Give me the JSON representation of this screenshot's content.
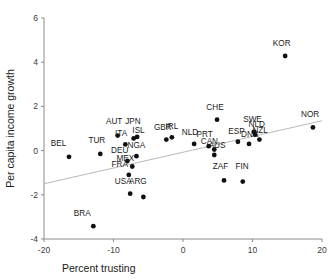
{
  "chart_data": {
    "type": "scatter",
    "title": "",
    "xlabel": "Percent trusting",
    "ylabel": "Per capita income growth",
    "xlim": [
      -20,
      20
    ],
    "ylim": [
      -4,
      6
    ],
    "xticks": [
      -20,
      -10,
      0,
      10,
      20
    ],
    "xtick_labels": [
      "-20",
      "-10",
      "0",
      "10",
      "20"
    ],
    "yticks": [
      -4,
      -2,
      0,
      2,
      4,
      6
    ],
    "ytick_labels": [
      "-4",
      "-2",
      "0",
      "2",
      "4",
      "6"
    ],
    "grid": false,
    "legend": false,
    "trend_line": {
      "type": "linear-fit",
      "x_start": -20,
      "y_start": -1.5,
      "x_end": 20,
      "y_end": 1.35
    },
    "point_label_color": "#1a1a1a",
    "marker_color": "#101010",
    "trend_line_color": "#b9b9b9",
    "axis_color": "#8a8a8a",
    "points": [
      {
        "label": "BEL",
        "x": -16.4,
        "y": -0.28,
        "lx": -17.9,
        "ly": 0.22
      },
      {
        "label": "BRA",
        "x": -12.9,
        "y": -3.42,
        "lx": -14.5,
        "ly": -2.95
      },
      {
        "label": "TUR",
        "x": -11.9,
        "y": -0.15,
        "lx": -12.4,
        "ly": 0.35
      },
      {
        "label": "AUT",
        "x": -9.4,
        "y": 0.68,
        "lx": -9.9,
        "ly": 1.2
      },
      {
        "label": "ITA",
        "x": -8.3,
        "y": 0.28,
        "lx": -8.9,
        "ly": 0.67
      },
      {
        "label": "DEU",
        "x": -8.0,
        "y": -0.47,
        "lx": -9.1,
        "ly": -0.12
      },
      {
        "label": "FRA",
        "x": -7.8,
        "y": -1.1,
        "lx": -9.1,
        "ly": -0.72
      },
      {
        "label": "USA",
        "x": -7.6,
        "y": -1.95,
        "lx": -8.6,
        "ly": -1.5
      },
      {
        "label": "MEX",
        "x": -7.3,
        "y": -0.72,
        "lx": -8.3,
        "ly": -0.48
      },
      {
        "label": "JPN",
        "x": -7.1,
        "y": 0.55,
        "lx": -7.2,
        "ly": 1.2
      },
      {
        "label": "ISL",
        "x": -6.6,
        "y": 0.62,
        "lx": -6.4,
        "ly": 0.8
      },
      {
        "label": "NGA",
        "x": -6.7,
        "y": -0.25,
        "lx": -6.7,
        "ly": 0.1
      },
      {
        "label": "ARG",
        "x": -5.7,
        "y": -2.1,
        "lx": -6.5,
        "ly": -1.5
      },
      {
        "label": "GBR",
        "x": -2.4,
        "y": 0.5,
        "lx": -2.9,
        "ly": 0.95
      },
      {
        "label": "IRL",
        "x": -1.6,
        "y": 0.6,
        "lx": -1.6,
        "ly": 0.96
      },
      {
        "label": "NLD",
        "x": 1.6,
        "y": 0.3,
        "lx": 1.0,
        "ly": 0.72
      },
      {
        "label": "PRT",
        "x": 3.7,
        "y": 0.2,
        "lx": 3.1,
        "ly": 0.62
      },
      {
        "label": "CAN",
        "x": 4.5,
        "y": 0.05,
        "lx": 3.8,
        "ly": 0.28
      },
      {
        "label": "AUS",
        "x": 4.5,
        "y": -0.2,
        "lx": 4.9,
        "ly": 0.1
      },
      {
        "label": "CHE",
        "x": 4.9,
        "y": 1.4,
        "lx": 4.6,
        "ly": 1.85
      },
      {
        "label": "ZAF",
        "x": 5.9,
        "y": -1.35,
        "lx": 5.4,
        "ly": -0.85
      },
      {
        "label": "ESP",
        "x": 7.9,
        "y": 0.4,
        "lx": 7.7,
        "ly": 0.75
      },
      {
        "label": "FIN",
        "x": 8.6,
        "y": -1.4,
        "lx": 8.5,
        "ly": -0.85
      },
      {
        "label": "DNK",
        "x": 9.5,
        "y": 0.3,
        "lx": 9.6,
        "ly": 0.62
      },
      {
        "label": "SWE",
        "x": 10.2,
        "y": 0.85,
        "lx": 10.0,
        "ly": 1.3
      },
      {
        "label": "NLD2",
        "x": 10.4,
        "y": 0.72,
        "lx": 10.6,
        "ly": 1.05
      },
      {
        "label": "NZL",
        "x": 11.0,
        "y": 0.5,
        "lx": 11.1,
        "ly": 0.78
      },
      {
        "label": "KOR",
        "x": 14.7,
        "y": 4.28,
        "lx": 14.2,
        "ly": 4.75
      },
      {
        "label": "NOR",
        "x": 18.7,
        "y": 1.05,
        "lx": 18.3,
        "ly": 1.5
      }
    ]
  }
}
